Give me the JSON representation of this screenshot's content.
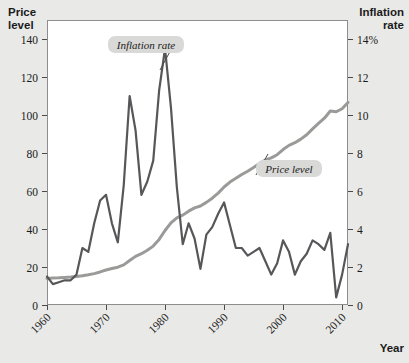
{
  "chart_data": {
    "type": "line",
    "title": "",
    "xlabel": "Year",
    "left_axis": {
      "label_line1": "Price",
      "label_line2": "level",
      "ticks": [
        "0",
        "20",
        "40",
        "60",
        "80",
        "100",
        "120",
        "140"
      ],
      "tick_values": [
        0,
        20,
        40,
        60,
        80,
        100,
        120,
        140
      ],
      "ylim": [
        0,
        150
      ]
    },
    "right_axis": {
      "label_line1": "Inflation",
      "label_line2": "rate",
      "ticks": [
        "0",
        "2",
        "4",
        "6",
        "8",
        "10",
        "12",
        "14%"
      ],
      "tick_values": [
        0,
        2,
        4,
        6,
        8,
        10,
        12,
        14
      ],
      "ylim": [
        0,
        15
      ]
    },
    "x_ticks": [
      "1960",
      "1970",
      "1980",
      "1990",
      "2000",
      "2010"
    ],
    "x_tick_values": [
      1960,
      1970,
      1980,
      1990,
      2000,
      2010
    ],
    "xlim": [
      1960,
      2011
    ],
    "grid": false,
    "legend": "annotations",
    "annotations": [
      {
        "text": "Inflation rate",
        "series": "inflation_rate"
      },
      {
        "text": "Price level",
        "series": "price_level"
      }
    ],
    "series": [
      {
        "name": "Price level",
        "axis": "left",
        "color": "#9a9a98",
        "x": [
          1960,
          1961,
          1962,
          1963,
          1964,
          1965,
          1966,
          1967,
          1968,
          1969,
          1970,
          1971,
          1972,
          1973,
          1974,
          1975,
          1976,
          1977,
          1978,
          1979,
          1980,
          1981,
          1982,
          1983,
          1984,
          1985,
          1986,
          1987,
          1988,
          1989,
          1990,
          1991,
          1992,
          1993,
          1994,
          1995,
          1996,
          1997,
          1998,
          1999,
          2000,
          2001,
          2002,
          2003,
          2004,
          2005,
          2006,
          2007,
          2008,
          2009,
          2010,
          2011
        ],
        "values": [
          14.0,
          14.2,
          14.3,
          14.5,
          14.7,
          15.0,
          15.4,
          15.9,
          16.5,
          17.4,
          18.4,
          19.2,
          19.9,
          21.1,
          23.4,
          25.6,
          27.0,
          28.8,
          31.0,
          34.5,
          39.2,
          43.2,
          45.9,
          47.3,
          49.4,
          51.1,
          52.1,
          54.0,
          56.2,
          58.9,
          62.1,
          64.7,
          66.7,
          68.7,
          70.4,
          72.4,
          74.5,
          76.3,
          77.4,
          79.1,
          81.8,
          84.0,
          85.4,
          87.3,
          89.6,
          92.7,
          95.6,
          98.3,
          102.1,
          101.7,
          103.3,
          106.6
        ]
      },
      {
        "name": "Inflation rate",
        "axis": "right",
        "color": "#57575a",
        "x": [
          1960,
          1961,
          1962,
          1963,
          1964,
          1965,
          1966,
          1967,
          1968,
          1969,
          1970,
          1971,
          1972,
          1973,
          1974,
          1975,
          1976,
          1977,
          1978,
          1979,
          1980,
          1981,
          1982,
          1983,
          1984,
          1985,
          1986,
          1987,
          1988,
          1989,
          1990,
          1991,
          1992,
          1993,
          1994,
          1995,
          1996,
          1997,
          1998,
          1999,
          2000,
          2001,
          2002,
          2003,
          2004,
          2005,
          2006,
          2007,
          2008,
          2009,
          2010,
          2011
        ],
        "values": [
          1.5,
          1.1,
          1.2,
          1.3,
          1.3,
          1.6,
          3.0,
          2.8,
          4.3,
          5.5,
          5.8,
          4.3,
          3.3,
          6.3,
          11.0,
          9.2,
          5.8,
          6.5,
          7.6,
          11.3,
          13.5,
          10.4,
          6.2,
          3.2,
          4.3,
          3.5,
          1.9,
          3.7,
          4.1,
          4.8,
          5.4,
          4.2,
          3.0,
          3.0,
          2.6,
          2.8,
          3.0,
          2.3,
          1.6,
          2.2,
          3.4,
          2.8,
          1.6,
          2.3,
          2.7,
          3.4,
          3.2,
          2.9,
          3.8,
          0.4,
          1.6,
          3.2
        ]
      }
    ]
  },
  "geometry": {
    "plot": {
      "x": 47,
      "y": 20,
      "w": 301,
      "h": 285
    }
  }
}
